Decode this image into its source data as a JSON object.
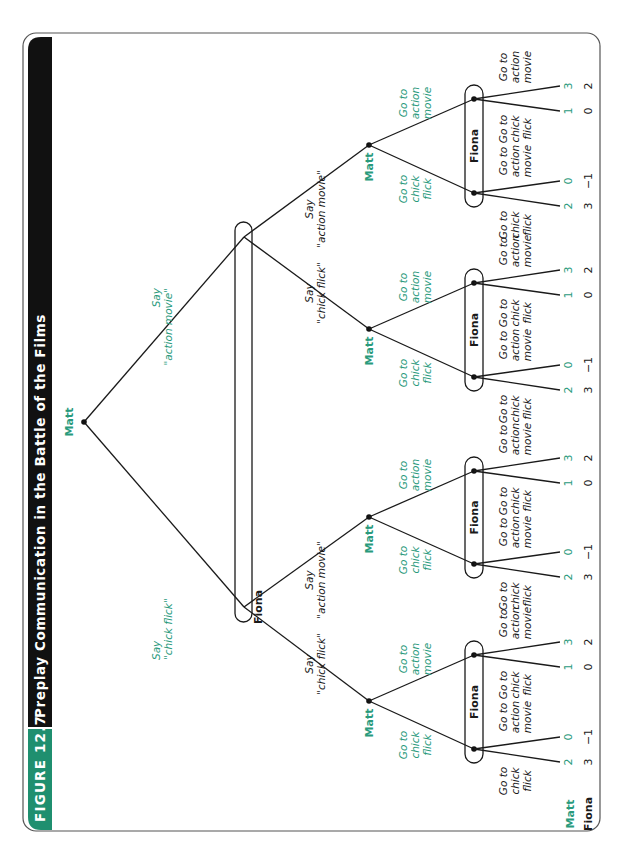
{
  "figure": {
    "label": "FIGURE 12.7",
    "title": "Preplay Communication in the Battle of the Films",
    "colors": {
      "accent_teal": "#1f8f6f",
      "title_bar": "#111111",
      "matt_text": "#2a9a7c",
      "fiona_text": "#1a1a1a"
    }
  },
  "players": {
    "matt": "Matt",
    "fiona": "Fiona"
  },
  "payoff_header": {
    "matt": "Matt",
    "fiona": "Fiona"
  },
  "tree": {
    "root": {
      "player": "Matt",
      "x": 84,
      "y": 422
    },
    "root_actions": [
      {
        "label_line1": "Say",
        "label_line2": "\"chick flick\"",
        "to": "fiona_cf"
      },
      {
        "label_line1": "Say",
        "label_line2": "\"action movie\"",
        "to": "fiona_am"
      }
    ],
    "fiona_infoset": {
      "label": "Fiona",
      "nodes": [
        {
          "id": "fiona_cf",
          "x": 244,
          "y": 607
        },
        {
          "id": "fiona_am",
          "x": 244,
          "y": 237
        }
      ]
    },
    "fiona_actions_label": {
      "line1": "Say"
    },
    "matt_subtrees": [
      {
        "parent": "fiona_cf",
        "fiona_says": "\"chick flick\"",
        "matt_x": 369,
        "matt_y": 701,
        "fiona_cf_node_y": 749,
        "fiona_am_node_y": 655
      },
      {
        "parent": "fiona_cf",
        "fiona_says": "\"action movie\"",
        "matt_x": 369,
        "matt_y": 517,
        "fiona_cf_node_y": 564,
        "fiona_am_node_y": 471
      },
      {
        "parent": "fiona_am",
        "fiona_says": "\"chick flick\"",
        "matt_x": 369,
        "matt_y": 329,
        "fiona_cf_node_y": 377,
        "fiona_am_node_y": 283
      },
      {
        "parent": "fiona_am",
        "fiona_says": "\"action movie\"",
        "matt_x": 369,
        "matt_y": 145,
        "fiona_cf_node_y": 193,
        "fiona_am_node_y": 99
      }
    ],
    "matt_action_labels": {
      "chick": [
        "Go to",
        "chick",
        "flick"
      ],
      "action": [
        "Go to",
        "action",
        "movie"
      ]
    },
    "fiona_action_labels": {
      "chick": [
        "Go to",
        "chick",
        "flick"
      ],
      "action": [
        "Go to",
        "action",
        "movie"
      ]
    },
    "payoffs": {
      "cf_cf": {
        "matt": "2",
        "fiona": "3"
      },
      "cf_am": {
        "matt": "0",
        "fiona": "−1"
      },
      "am_cf": {
        "matt": "1",
        "fiona": "0"
      },
      "am_am": {
        "matt": "3",
        "fiona": "2"
      }
    }
  }
}
